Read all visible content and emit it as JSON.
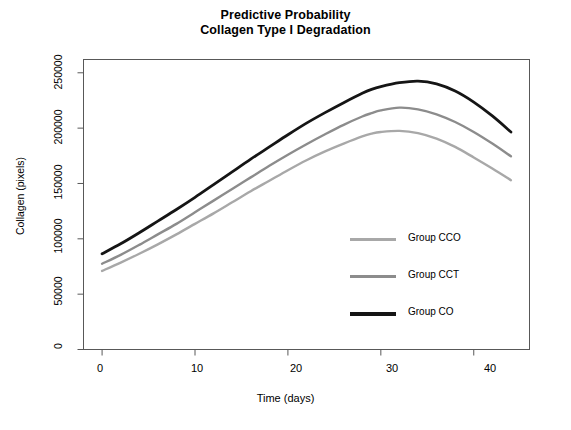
{
  "chart_data": {
    "type": "line",
    "title": "Predictive Probability\nCollagen Type I Degradation",
    "title_line1": "Predictive Probability",
    "title_line2": "Collagen Type I Degradation",
    "xlabel": "Time (days)",
    "ylabel": "Collagen (pixels)",
    "xlim": [
      -2,
      46
    ],
    "ylim": [
      0,
      262000
    ],
    "xticks": [
      0,
      10,
      20,
      30,
      40
    ],
    "xtick_labels": [
      "0",
      "10",
      "20",
      "30",
      "40"
    ],
    "yticks": [
      0,
      50000,
      100000,
      150000,
      200000,
      250000
    ],
    "ytick_labels": [
      "0",
      "50000",
      "100000",
      "150000",
      "200000",
      "250000"
    ],
    "grid": false,
    "legend_position": "center right inside",
    "x": [
      0,
      2,
      4,
      6,
      8,
      10,
      12,
      14,
      16,
      18,
      20,
      22,
      24,
      26,
      28,
      29,
      30,
      32,
      34,
      36,
      38,
      40,
      42,
      44
    ],
    "series": [
      {
        "name": "Group CCO",
        "color": "#a8a8a8",
        "linewidth": 2.4,
        "values": [
          71000,
          78500,
          86500,
          95000,
          104000,
          113500,
          123000,
          133000,
          143000,
          152500,
          162000,
          171000,
          179000,
          186000,
          192500,
          195000,
          196500,
          197500,
          195500,
          190500,
          183000,
          173500,
          163500,
          153000
        ]
      },
      {
        "name": "Group CCT",
        "color": "#8c8c8c",
        "linewidth": 2.4,
        "values": [
          77500,
          85500,
          94500,
          104000,
          113500,
          124000,
          134500,
          145000,
          155500,
          166000,
          176000,
          185500,
          194500,
          203000,
          210500,
          213500,
          216000,
          218500,
          217000,
          212500,
          205500,
          196500,
          186000,
          174500
        ]
      },
      {
        "name": "Group CO",
        "color": "#151515",
        "linewidth": 2.8,
        "values": [
          86500,
          95500,
          105500,
          116000,
          126500,
          137500,
          149000,
          160500,
          172000,
          183000,
          194000,
          204500,
          214000,
          223000,
          231500,
          235000,
          237500,
          241000,
          242500,
          240000,
          233500,
          223500,
          211000,
          196500
        ]
      }
    ]
  },
  "legend": {
    "entries": [
      {
        "label": "Group CCO",
        "color": "#a8a8a8"
      },
      {
        "label": "Group CCT",
        "color": "#8c8c8c"
      },
      {
        "label": "Group CO",
        "color": "#151515"
      }
    ]
  },
  "axis": {
    "frame_color": "#585858"
  }
}
